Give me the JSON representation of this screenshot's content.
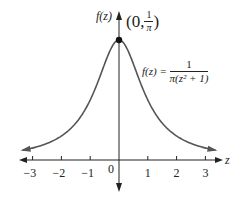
{
  "chart_data": {
    "type": "line",
    "title": "",
    "function": "f(z) = 1 / (π(z² + 1))",
    "xlabel": "z",
    "ylabel": "f(z)",
    "x_ticks": [
      -3,
      -2,
      -1,
      0,
      1,
      2,
      3
    ],
    "x_tick_labels": [
      "−3",
      "−2",
      "−1",
      "0",
      "1",
      "2",
      "3"
    ],
    "xlim": [
      -3.4,
      3.5
    ],
    "ylim": [
      -0.08,
      0.39
    ],
    "grid": false,
    "legend": null,
    "series": [
      {
        "name": "f(z) = 1/(π(z²+1))",
        "x": [
          -3.4,
          -3,
          -2.5,
          -2,
          -1.5,
          -1,
          -0.5,
          0,
          0.5,
          1,
          1.5,
          2,
          2.5,
          3,
          3.4
        ],
        "values": [
          0.0253,
          0.0318,
          0.0439,
          0.0637,
          0.0979,
          0.1592,
          0.2546,
          0.3183,
          0.2546,
          0.1592,
          0.0979,
          0.0637,
          0.0439,
          0.0318,
          0.0253
        ]
      }
    ],
    "annotations": [
      {
        "text": "(0, 1/π)",
        "x": 0,
        "y": 0.3183,
        "marker": "filled-circle"
      },
      {
        "text": "f(z) = 1/(π(z² + 1))",
        "position": "right of curve near peak"
      }
    ]
  },
  "labels": {
    "y_axis": "f(z)",
    "x_axis": "z",
    "point_open": "(0,",
    "point_num": "1",
    "point_den": "π",
    "point_close": ")",
    "formula_lhs": "f(z) =",
    "formula_num": "1",
    "formula_den": "π(z² + 1)",
    "ticks": [
      "−3",
      "−2",
      "−1",
      "0",
      "1",
      "2",
      "3"
    ]
  },
  "colors": {
    "axis": "#222222",
    "curve": "#555555",
    "point": "#111111"
  }
}
